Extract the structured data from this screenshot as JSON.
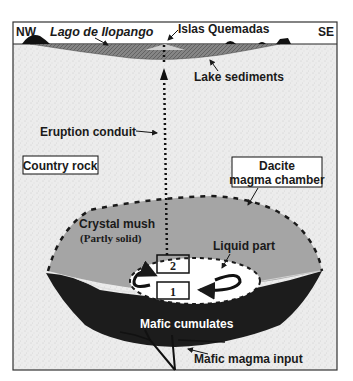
{
  "directions": {
    "left": "NW",
    "right": "SE"
  },
  "labels": {
    "lake": "Lago de Ilopango",
    "islands": "Islas Quemadas",
    "sediments": "Lake sediments",
    "conduit": "Eruption conduit",
    "country_rock": "Country rock",
    "chamber_line1": "Dacite",
    "chamber_line2": "magma chamber",
    "mush_line1": "Crystal mush",
    "mush_line2": "(Partly solid)",
    "liquid": "Liquid part",
    "box_upper": "2",
    "box_lower": "1",
    "cumulates": "Mafic cumulates",
    "mafic_input": "Mafic magma input"
  },
  "colors": {
    "country_rock": "#e9e9e9",
    "mush": "#a3a3a3",
    "cumulates": "#1c1c1c",
    "sediments": "#7a7a7a",
    "liquid": "#ffffff",
    "outline": "#222222"
  }
}
